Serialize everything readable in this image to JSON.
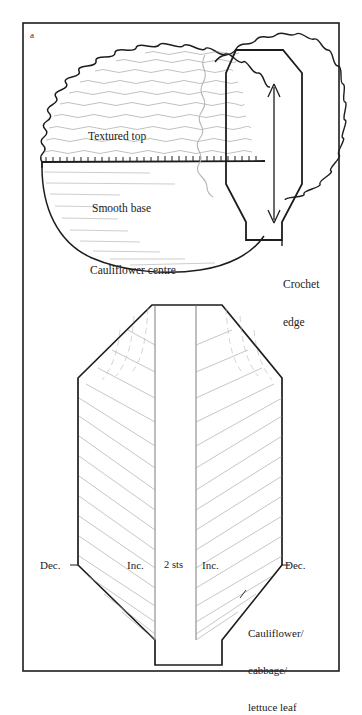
{
  "figure": {
    "panel_letter": "a",
    "background_color": "#ffffff",
    "ink_color": "#1a1a1a",
    "frame": {
      "stroke": "#1a1a1a"
    }
  },
  "upper_diagram": {
    "name": "cauliflower centre with crochet edge",
    "labels": {
      "textured_top": "Textured top",
      "smooth_base": "Smooth base",
      "cauliflower_centre": "Cauliflower centre",
      "crochet_edge_line1": "Crochet",
      "crochet_edge_line2": "edge"
    }
  },
  "lower_diagram": {
    "name": "cauliflower cabbage lettuce leaf",
    "labels": {
      "dec_left": "Dec.",
      "inc_left": "Inc.",
      "centre_stitches": "2 sts",
      "inc_right": "Inc.",
      "dec_right": "Dec.",
      "caption_line1": "Cauliflower/",
      "caption_line2": "cabbage/",
      "caption_line3": "lettuce leaf"
    }
  }
}
